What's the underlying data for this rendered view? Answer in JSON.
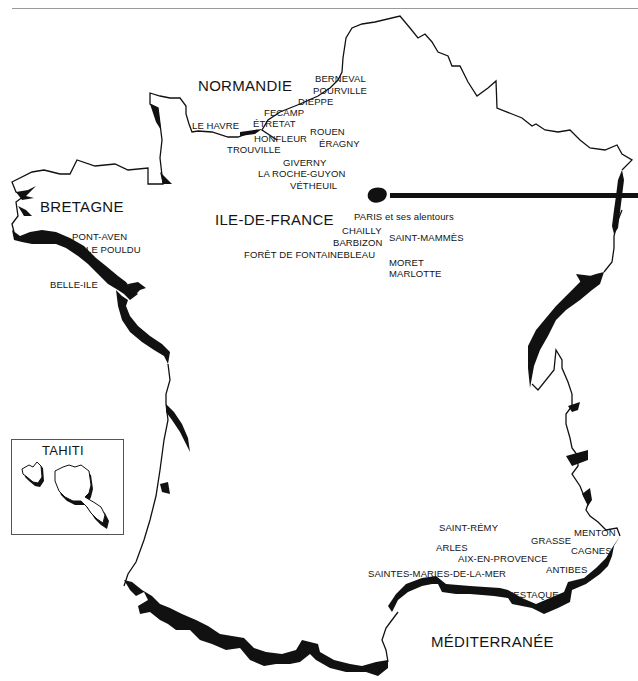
{
  "map": {
    "title": "Lieux de peinture en France",
    "ink_color": "#111111",
    "background_color": "#ffffff",
    "regions": {
      "normandie": "NORMANDIE",
      "bretagne": "BRETAGNE",
      "ile_de_france": "ILE-DE-FRANCE",
      "mediterranee": "MÉDITERRANÉE"
    },
    "inset": {
      "title": "TAHITI"
    },
    "places": {
      "berneval": "BERNEVAL",
      "pourville": "POURVILLE",
      "dieppe": "DIEPPE",
      "fecamp": "FECAMP",
      "le_havre": "LE  HAVRE",
      "etretat": "ÉTRETAT",
      "honfleur": "HONFLEUR",
      "trouville": "TROUVILLE",
      "rouen": "ROUEN",
      "eragny": "ÉRAGNY",
      "giverny": "GIVERNY",
      "la_roche_guyon": "LA  ROCHE-GUYON",
      "vetheuil": "VÉTHEUIL",
      "paris": "PARIS",
      "paris_suffix": "et ses alentours",
      "chailly": "CHAILLY",
      "barbizon": "BARBIZON",
      "saint_mammes": "SAINT-MAMMÈS",
      "foret_fontainebleau": "FORÊT  DE  FONTAINEBLEAU",
      "moret": "MORET",
      "marlotte": "MARLOTTE",
      "pont_aven": "PONT-AVEN",
      "le_pouldu": "LE  POULDU",
      "belle_ile": "BELLE-ILE",
      "saint_remy": "SAINT-RÉMY",
      "arles": "ARLES",
      "aix_en_provence": "AIX-EN-PROVENCE",
      "saintes_maries": "SAINTES-MARIES-DE-LA-MER",
      "l_estaque": "L'ESTAQUE",
      "grasse": "GRASSE",
      "menton": "MENTON",
      "cagnes": "CAGNES",
      "antibes": "ANTIBES"
    }
  }
}
